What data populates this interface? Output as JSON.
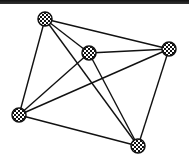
{
  "graph": {
    "type": "complete-graph",
    "nodes": [
      {
        "id": "n1",
        "x": 45,
        "y": 19
      },
      {
        "id": "n2",
        "x": 89,
        "y": 53
      },
      {
        "id": "n3",
        "x": 169,
        "y": 49
      },
      {
        "id": "n4",
        "x": 19,
        "y": 115
      },
      {
        "id": "n5",
        "x": 138,
        "y": 146
      }
    ],
    "edges": [
      [
        "n1",
        "n2"
      ],
      [
        "n1",
        "n3"
      ],
      [
        "n1",
        "n4"
      ],
      [
        "n1",
        "n5"
      ],
      [
        "n2",
        "n3"
      ],
      [
        "n2",
        "n4"
      ],
      [
        "n2",
        "n5"
      ],
      [
        "n3",
        "n4"
      ],
      [
        "n3",
        "n5"
      ],
      [
        "n4",
        "n5"
      ]
    ],
    "colors": {
      "edge": "#111111",
      "node_dark": "#111111",
      "node_light": "#ffffff",
      "topbar": "#222222"
    }
  }
}
